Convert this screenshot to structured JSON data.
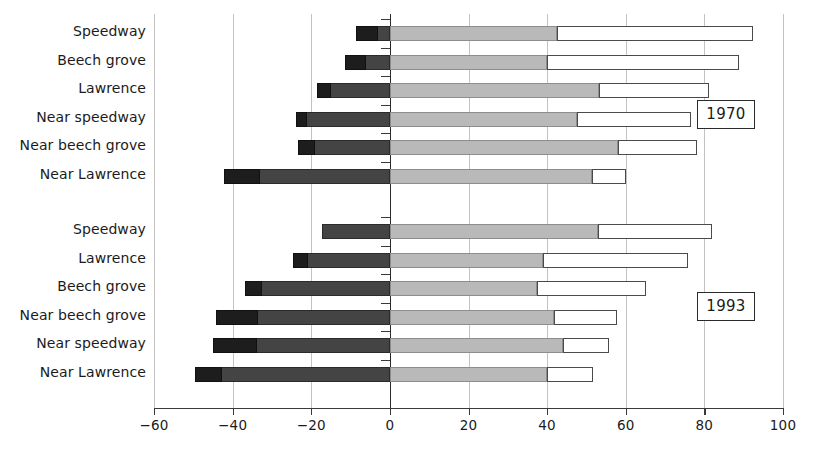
{
  "chart_data": {
    "type": "bar",
    "orientation": "horizontal",
    "subtype": "stacked-diverging",
    "title": "",
    "xlabel": "",
    "ylabel": "",
    "xlim": [
      -60,
      100
    ],
    "xticks": [
      -60,
      -40,
      -20,
      0,
      20,
      40,
      60,
      80,
      100
    ],
    "xticklabels": [
      "−60",
      "−40",
      "−20",
      "0",
      "20",
      "40",
      "60",
      "80",
      "100"
    ],
    "grid": true,
    "grid_axis": "x",
    "legend": null,
    "series_names": [
      "black",
      "dark-gray",
      "light-gray",
      "white"
    ],
    "groups": [
      {
        "name": "1970",
        "label": "1970",
        "categories": [
          "Speedway",
          "Beech grove",
          "Lawrence",
          "Near speedway",
          "Near beech grove",
          "Near Lawrence"
        ],
        "negative": [
          {
            "black_start": -8.5,
            "black_end": -3.0,
            "dark_end": 0
          },
          {
            "black_start": -11.5,
            "black_end": -6.0,
            "dark_end": 0
          },
          {
            "black_start": -18.6,
            "black_end": -15.0,
            "dark_end": 0
          },
          {
            "black_start": -24.0,
            "black_end": -21.0,
            "dark_end": 0
          },
          {
            "black_start": -23.4,
            "black_end": -19.0,
            "dark_end": 0
          },
          {
            "black_start": -42.2,
            "black_end": -33.0,
            "dark_end": 0
          }
        ],
        "positive": [
          {
            "light_end": 42.5,
            "white_end": 92.4
          },
          {
            "light_end": 40.0,
            "white_end": 88.8
          },
          {
            "light_end": 53.2,
            "white_end": 81.2
          },
          {
            "light_end": 47.6,
            "white_end": 76.6
          },
          {
            "light_end": 58.0,
            "white_end": 78.1
          },
          {
            "light_end": 51.4,
            "white_end": 60.0
          }
        ]
      },
      {
        "name": "1993",
        "label": "1993",
        "categories": [
          "Speedway",
          "Lawrence",
          "Beech grove",
          "Near beech grove",
          "Near speedway",
          "Near Lawrence"
        ],
        "negative": [
          {
            "black_start": -17.3,
            "black_end": -17.3,
            "dark_end": 0
          },
          {
            "black_start": -24.7,
            "black_end": -20.9,
            "dark_end": 0
          },
          {
            "black_start": -36.9,
            "black_end": -32.4,
            "dark_end": 0
          },
          {
            "black_start": -44.3,
            "black_end": -33.6,
            "dark_end": 0
          },
          {
            "black_start": -45.0,
            "black_end": -33.8,
            "dark_end": 0
          },
          {
            "black_start": -49.6,
            "black_end": -42.8,
            "dark_end": 0
          }
        ],
        "positive": [
          {
            "light_end": 53.0,
            "white_end": 82.0
          },
          {
            "light_end": 39.0,
            "white_end": 75.9
          },
          {
            "light_end": 37.4,
            "white_end": 65.2
          },
          {
            "light_end": 41.8,
            "white_end": 57.8
          },
          {
            "light_end": 44.0,
            "white_end": 55.7
          },
          {
            "light_end": 40.0,
            "white_end": 51.7
          }
        ]
      }
    ],
    "colors": {
      "black": "#1d1d1d",
      "dark_gray": "#444444",
      "light_gray": "#b9b9b9",
      "white": "#ffffff",
      "axis": "#3a3a3a",
      "grid": "#c3c3c3"
    }
  },
  "group_boxes": [
    {
      "label": "1970"
    },
    {
      "label": "1993"
    }
  ]
}
